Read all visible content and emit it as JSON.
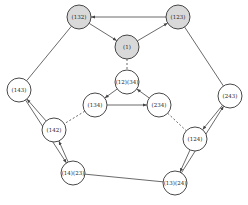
{
  "diagram": {
    "type": "cayley-graph",
    "colors": {
      "highlight_fill": "#d9d9d9",
      "default_fill": "#ffffff",
      "stroke": "#333333",
      "edge": "#444444"
    },
    "nodes": [
      {
        "id": "n132",
        "label": "(132)",
        "x": 79,
        "y": 17,
        "highlight": true
      },
      {
        "id": "n123",
        "label": "(123)",
        "x": 178,
        "y": 17,
        "highlight": true
      },
      {
        "id": "n1",
        "label": "(1)",
        "x": 127,
        "y": 47,
        "highlight": true
      },
      {
        "id": "n12_34",
        "label": "(12)(34)",
        "x": 127,
        "y": 82,
        "highlight": false
      },
      {
        "id": "n134",
        "label": "(134)",
        "x": 95,
        "y": 105,
        "highlight": false
      },
      {
        "id": "n234",
        "label": "(234)",
        "x": 159,
        "y": 105,
        "highlight": false
      },
      {
        "id": "n143",
        "label": "(143)",
        "x": 19,
        "y": 90,
        "highlight": false
      },
      {
        "id": "n243",
        "label": "(243)",
        "x": 230,
        "y": 96,
        "highlight": false
      },
      {
        "id": "n142",
        "label": "(142)",
        "x": 54,
        "y": 130,
        "highlight": false
      },
      {
        "id": "n124",
        "label": "(124)",
        "x": 195,
        "y": 139,
        "highlight": false
      },
      {
        "id": "n14_23",
        "label": "(14)(23)",
        "x": 73,
        "y": 173,
        "highlight": false
      },
      {
        "id": "n13_24",
        "label": "(13)(24)",
        "x": 175,
        "y": 183,
        "highlight": false
      }
    ],
    "edges": [
      {
        "from": "n123",
        "to": "n132",
        "style": "arrow"
      },
      {
        "from": "n132",
        "to": "n1",
        "style": "arrow"
      },
      {
        "from": "n1",
        "to": "n123",
        "style": "arrow"
      },
      {
        "from": "n1",
        "to": "n12_34",
        "style": "dashed"
      },
      {
        "from": "n132",
        "to": "n143",
        "style": "line"
      },
      {
        "from": "n123",
        "to": "n243",
        "style": "line"
      },
      {
        "from": "n12_34",
        "to": "n134",
        "style": "arrow"
      },
      {
        "from": "n134",
        "to": "n234",
        "style": "arrow"
      },
      {
        "from": "n234",
        "to": "n12_34",
        "style": "arrow"
      },
      {
        "from": "n134",
        "to": "n142",
        "style": "dashed"
      },
      {
        "from": "n234",
        "to": "n124",
        "style": "dashed"
      },
      {
        "from": "n142",
        "to": "n143",
        "style": "arrow"
      },
      {
        "from": "n143",
        "to": "n14_23",
        "style": "arrow"
      },
      {
        "from": "n14_23",
        "to": "n142",
        "style": "arrow"
      },
      {
        "from": "n243",
        "to": "n124",
        "style": "arrow"
      },
      {
        "from": "n124",
        "to": "n13_24",
        "style": "arrow"
      },
      {
        "from": "n13_24",
        "to": "n243",
        "style": "arrow"
      },
      {
        "from": "n14_23",
        "to": "n13_24",
        "style": "line"
      }
    ],
    "node_radius": 12
  }
}
